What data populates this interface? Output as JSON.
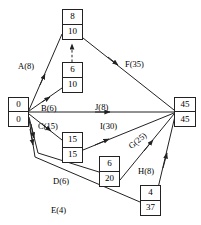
{
  "diagram": {
    "type": "activity-on-arrow-network",
    "stroke_color": "#222222",
    "background_color": "#ffffff"
  },
  "nodes": [
    {
      "id": "n-top",
      "top_value": "8",
      "bottom_value": "10",
      "x": 62,
      "y": 9,
      "w": 21,
      "h": 31
    },
    {
      "id": "n-upper-mid",
      "top_value": "6",
      "bottom_value": "10",
      "x": 62,
      "y": 62,
      "w": 21,
      "h": 31
    },
    {
      "id": "n-start",
      "top_value": "0",
      "bottom_value": "0",
      "x": 8,
      "y": 97,
      "w": 21,
      "h": 30
    },
    {
      "id": "n-end",
      "top_value": "45",
      "bottom_value": "45",
      "x": 174,
      "y": 97,
      "w": 22,
      "h": 30
    },
    {
      "id": "n-mid-low",
      "top_value": "15",
      "bottom_value": "15",
      "x": 62,
      "y": 132,
      "w": 21,
      "h": 31
    },
    {
      "id": "n-lower-mid",
      "top_value": "6",
      "bottom_value": "20",
      "x": 99,
      "y": 156,
      "w": 21,
      "h": 31
    },
    {
      "id": "n-bottom",
      "top_value": "4",
      "bottom_value": "37",
      "x": 140,
      "y": 185,
      "w": 21,
      "h": 31
    }
  ],
  "edges": [
    {
      "id": "edge-a",
      "label": "A(8)",
      "label_x": 18,
      "label_y": 62,
      "rotate": 0
    },
    {
      "id": "edge-b",
      "label": "B(6)",
      "label_x": 41,
      "label_y": 104,
      "rotate": 0
    },
    {
      "id": "edge-c",
      "label": "C(15)",
      "label_x": 38,
      "label_y": 122,
      "rotate": 0
    },
    {
      "id": "edge-d",
      "label": "D(6)",
      "label_x": 53,
      "label_y": 177,
      "rotate": 0
    },
    {
      "id": "edge-e",
      "label": "E(4)",
      "label_x": 51,
      "label_y": 206,
      "rotate": 0
    },
    {
      "id": "edge-f",
      "label": "F(35)",
      "label_x": 125,
      "label_y": 60,
      "rotate": 0
    },
    {
      "id": "edge-g",
      "label": "G(25)",
      "label_x": 127,
      "label_y": 144,
      "rotate": -40
    },
    {
      "id": "edge-h",
      "label": "H(8)",
      "label_x": 138,
      "label_y": 167,
      "rotate": 0
    },
    {
      "id": "edge-i",
      "label": "I(30)",
      "label_x": 100,
      "label_y": 122,
      "rotate": 0
    },
    {
      "id": "edge-j",
      "label": "J(8)",
      "label_x": 95,
      "label_y": 103,
      "rotate": 0
    }
  ]
}
